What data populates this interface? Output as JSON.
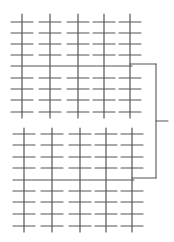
{
  "diagram": {
    "stroke_color": "#555555",
    "background": "#ffffff",
    "blocks": [
      {
        "name": "top-grid",
        "columns_x": [
          22,
          50,
          78,
          104,
          130
        ],
        "col_top": 14,
        "col_bottom": 118,
        "tick_rows_y": [
          22,
          33,
          44,
          55,
          78,
          89,
          100,
          112
        ],
        "long_row_y": 66,
        "tick_half_width": 11
      },
      {
        "name": "bottom-grid",
        "columns_x": [
          24,
          52,
          80,
          106,
          132
        ],
        "col_top": 128,
        "col_bottom": 232,
        "tick_rows_y": [
          134,
          145,
          157,
          168,
          191,
          202,
          214,
          226
        ],
        "long_row_y": 180,
        "tick_half_width": 11
      }
    ],
    "bracket": {
      "x": 156,
      "top_y": 64,
      "bottom_y": 178,
      "mid_y": 121,
      "stub_end_x": 168,
      "top_start_x": 130,
      "bottom_start_x": 132
    }
  }
}
